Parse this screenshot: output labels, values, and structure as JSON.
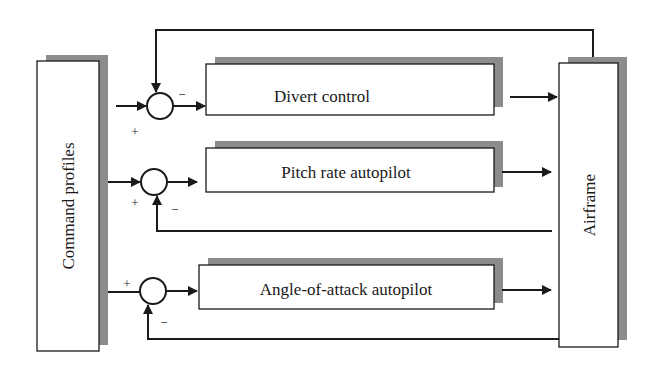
{
  "diagram": {
    "type": "block-diagram",
    "blocks": {
      "command": "Command profiles",
      "divert": "Divert control",
      "pitch": "Pitch rate autopilot",
      "aoa": "Angle-of-attack autopilot",
      "airframe": "Airframe"
    },
    "signs": {
      "sum1_minus": "−",
      "sum1_plus": "+",
      "sum2_plus": "+",
      "sum2_minus": "−",
      "sum3_plus": "+",
      "sum3_minus": "−"
    },
    "colors": {
      "line": "#1a1a1a",
      "shadow": "#8c8c8c",
      "box_fill": "#ffffff"
    }
  }
}
